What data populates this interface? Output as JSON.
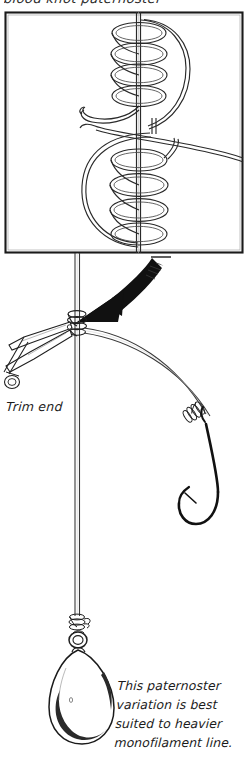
{
  "document": {
    "kind": "fishing-knot-instruction-diagram",
    "title_partial": "blood knot paternoster"
  },
  "labels": {
    "trim_end": "Trim end",
    "caption_line_1": "This paternoster",
    "caption_line_2": "variation is best",
    "caption_line_3": "suited to heavier",
    "caption_line_4": "monofilament line."
  },
  "diagram": {
    "detail_box": {
      "name": "coil-detail-box",
      "x": 5,
      "y": 12,
      "width": 238,
      "height": 241,
      "stroke": "#1a1a1a"
    },
    "elements": [
      {
        "name": "standing-line",
        "type": "mono-line"
      },
      {
        "name": "upper-coil-wraps",
        "turns": 4
      },
      {
        "name": "lower-coil-wraps",
        "turns": 4
      },
      {
        "name": "dropper-loop-tag"
      },
      {
        "name": "pointer-arrow",
        "fill": "#111111"
      },
      {
        "name": "knot-cinched"
      },
      {
        "name": "scissors"
      },
      {
        "name": "dropper-line"
      },
      {
        "name": "hook-snell-wraps"
      },
      {
        "name": "hook"
      },
      {
        "name": "sinker-knot"
      },
      {
        "name": "sinker-ring"
      },
      {
        "name": "teardrop-sinker"
      }
    ],
    "colors": {
      "ink": "#1a1a1a",
      "line": "#3a3a3a",
      "arrow": "#111111",
      "paper": "#ffffff"
    }
  }
}
